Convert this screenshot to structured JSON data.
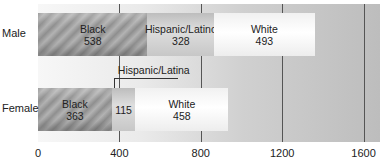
{
  "chart_data": {
    "type": "bar",
    "orientation": "horizontal",
    "stacked": true,
    "title": "",
    "xlabel": "",
    "ylabel": "",
    "xlim": [
      0,
      1680
    ],
    "x_ticks": [
      "0",
      "400",
      "800",
      "1200",
      "1600"
    ],
    "categories": [
      "Male",
      "Female"
    ],
    "series": [
      {
        "name": "Black",
        "values": [
          538,
          363
        ]
      },
      {
        "name": "Hispanic/Latino",
        "values": [
          328,
          115
        ]
      },
      {
        "name": "White",
        "values": [
          493,
          458
        ]
      }
    ],
    "segment_labels": {
      "Male": [
        {
          "label": "Black",
          "value": "538"
        },
        {
          "label": "Hispanic/Latino",
          "value": "328"
        },
        {
          "label": "White",
          "value": "493"
        }
      ],
      "Female": [
        {
          "label": "Black",
          "value": "363"
        },
        {
          "label": "",
          "value": "115"
        },
        {
          "label": "White",
          "value": "458"
        }
      ]
    },
    "annotations": [
      {
        "text": "Hispanic/Latina",
        "target": "Female Hispanic segment"
      }
    ],
    "grid": true,
    "legend": "none"
  }
}
